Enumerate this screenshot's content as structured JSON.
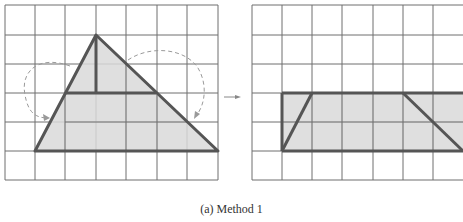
{
  "caption": "(a) Method 1",
  "colors": {
    "grid": "#6e6e6e",
    "shape_stroke": "#555555",
    "shape_fill": "#d9d9d9",
    "dashed_arrow": "#9a9a9a",
    "background": "#ffffff"
  },
  "left_figure": {
    "description": "Triangle on 7x6 grid with top portion cut and rotated down to both sides",
    "grid": {
      "cols": 7,
      "rows": 6
    },
    "triangle_vertices": [
      [
        1,
        5
      ],
      [
        3,
        1
      ],
      [
        7,
        5
      ]
    ],
    "cut_lines": [
      "vertical from apex to midline",
      "horizontal at row 3"
    ]
  },
  "right_figure": {
    "description": "Resulting rectangle of height 2 after rearrangement",
    "grid": {
      "cols": 7,
      "rows": 6
    },
    "rectangle": {
      "x": 1,
      "y": 3,
      "w": 6,
      "h": 2
    }
  },
  "arrow_label": "→"
}
